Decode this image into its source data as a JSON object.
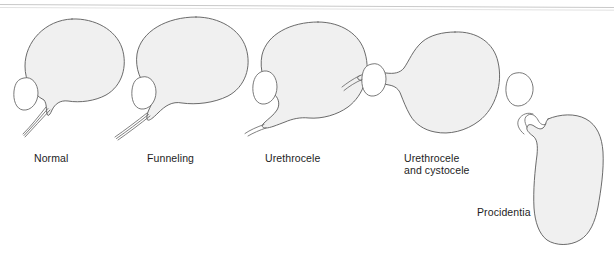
{
  "figure": {
    "background_color": "#ffffff",
    "shape_fill_color": "#f0f0f0",
    "shape_stroke_color": "#5a5a5a",
    "label_color": "#1d1d1d"
  },
  "panels": [
    {
      "id": "normal",
      "label": "Normal",
      "label_x": 34,
      "label_y": 152,
      "description": "Rounded bladder with narrow urethra and pubic bone ellipse"
    },
    {
      "id": "funneling",
      "label": "Funneling",
      "label_x": 147,
      "label_y": 152,
      "description": "Bladder neck begins to funnel open"
    },
    {
      "id": "urethrocele",
      "label": "Urethrocele",
      "label_x": 265,
      "label_y": 152,
      "description": "Urethra descends and widens below the pubic bone"
    },
    {
      "id": "urethrocele-and-cystocele",
      "label": "Urethrocele\nand cystocele",
      "label_x": 404,
      "label_y": 152,
      "description": "Both urethra and bladder base descend"
    },
    {
      "id": "procidentia",
      "label": "Procidentia",
      "label_x": 477,
      "label_y": 206,
      "description": "Complete prolapse, organ descends well below the pubic bone"
    }
  ]
}
